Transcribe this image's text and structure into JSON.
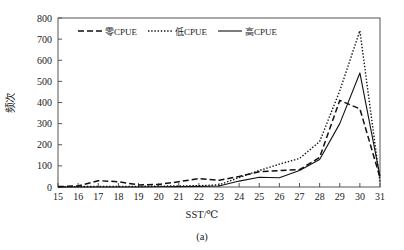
{
  "figure": {
    "caption": "(a)",
    "background": "#ffffff",
    "line_color": "#111111",
    "axis_color": "#555555"
  },
  "chart_data": {
    "type": "line",
    "title": "",
    "xlabel": "SST/℃",
    "ylabel": "频次",
    "xlim": [
      15,
      31
    ],
    "ylim": [
      0,
      800
    ],
    "xticks": [
      15,
      16,
      17,
      18,
      19,
      20,
      21,
      22,
      23,
      24,
      25,
      26,
      27,
      28,
      29,
      30,
      31
    ],
    "yticks": [
      0,
      100,
      200,
      300,
      400,
      500,
      600,
      700,
      800
    ],
    "grid": false,
    "legend_position": "top-center",
    "x": [
      15,
      16,
      17,
      18,
      19,
      20,
      21,
      22,
      23,
      24,
      25,
      26,
      27,
      28,
      29,
      30,
      31
    ],
    "series": [
      {
        "name": "零CPUE",
        "style": "dashed",
        "values": [
          2,
          5,
          30,
          25,
          10,
          12,
          25,
          40,
          32,
          50,
          72,
          78,
          82,
          140,
          410,
          370,
          45
        ]
      },
      {
        "name": "低CPUE",
        "style": "dotted",
        "values": [
          1,
          2,
          3,
          3,
          3,
          4,
          5,
          6,
          10,
          45,
          78,
          108,
          135,
          215,
          455,
          740,
          25
        ]
      },
      {
        "name": "高CPUE",
        "style": "solid",
        "values": [
          0,
          0,
          0,
          0,
          0,
          1,
          2,
          3,
          5,
          28,
          46,
          44,
          78,
          130,
          300,
          540,
          50
        ]
      }
    ]
  },
  "legend": {
    "items": [
      {
        "label": "零CPUE",
        "style": "dashed"
      },
      {
        "label": "低CPUE",
        "style": "dotted"
      },
      {
        "label": "高CPUE",
        "style": "solid"
      }
    ]
  }
}
